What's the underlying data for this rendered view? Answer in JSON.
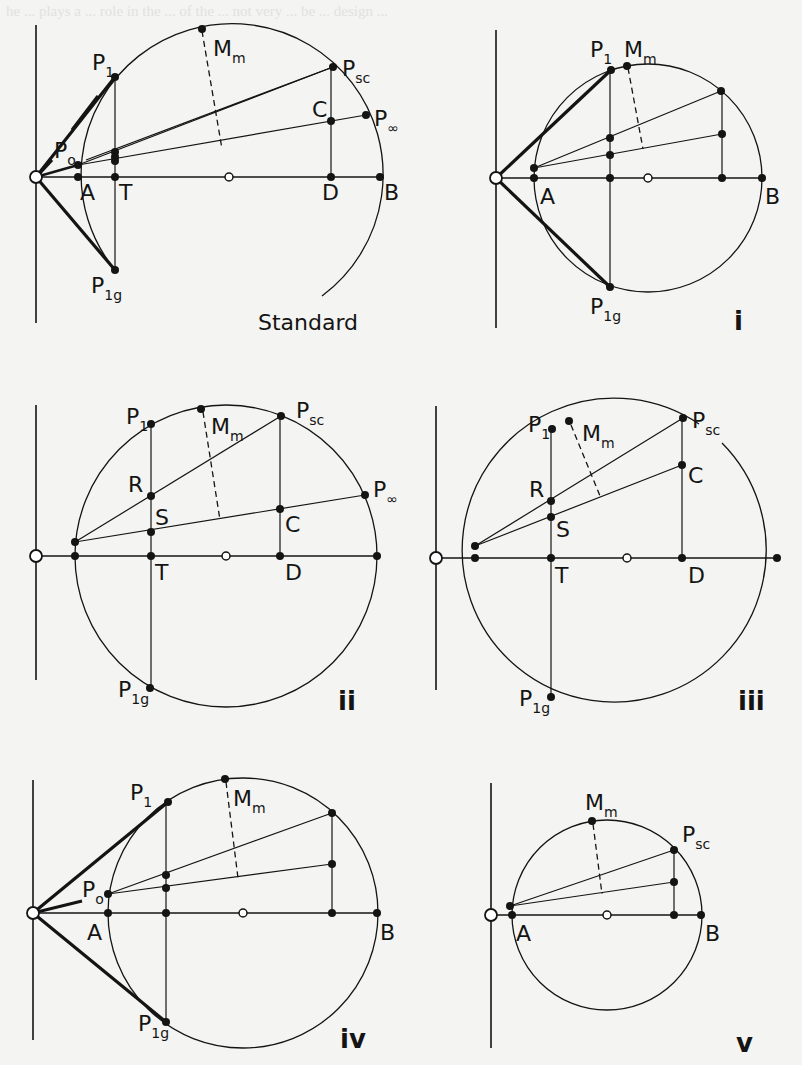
{
  "figure": {
    "background_color": "#f4f4f2",
    "ink_color": "#141414",
    "ghost_text_color": "#e2e2df",
    "background_text": "he ... plays a ... role in the ... of the ... not very ... be ... design ...",
    "diagrams": [
      {
        "id": "standard",
        "caption": "Standard",
        "caption_pos": [
          258,
          330
        ],
        "axis": {
          "vx": 36,
          "vy1": 25,
          "vy2": 323,
          "y": 177,
          "x1": 36,
          "x2": 380
        },
        "origin": [
          36,
          177
        ],
        "center": [
          229,
          177
        ],
        "radius": 151,
        "arc_partial": true,
        "arc_start": [
          115,
          270
        ],
        "arc_end": [
          322,
          296
        ],
        "points": {
          "A": [
            78,
            177
          ],
          "T": [
            115,
            177
          ],
          "D": [
            331,
            177
          ],
          "B": [
            380,
            177
          ],
          "P1": [
            115,
            77
          ],
          "P1g": [
            115,
            270
          ],
          "Mm": [
            202,
            29
          ],
          "Psc": [
            333,
            67
          ],
          "C": [
            331,
            121
          ],
          "Pinf": [
            366,
            115
          ],
          "P0": [
            78,
            165
          ]
        },
        "labels": [
          {
            "text": "P",
            "sub": "1",
            "x": 92,
            "y": 70
          },
          {
            "text": "M",
            "sub": "m",
            "x": 213,
            "y": 56
          },
          {
            "text": "P",
            "sub": "sc",
            "x": 342,
            "y": 76
          },
          {
            "text": "C",
            "sub": "",
            "x": 312,
            "y": 117
          },
          {
            "text": "P",
            "sub": "∞",
            "x": 374,
            "y": 126
          },
          {
            "text": "P",
            "sub": "o",
            "x": 54,
            "y": 158
          },
          {
            "text": "A",
            "sub": "",
            "x": 80,
            "y": 200
          },
          {
            "text": "T",
            "sub": "",
            "x": 119,
            "y": 200
          },
          {
            "text": "D",
            "sub": "",
            "x": 322,
            "y": 200
          },
          {
            "text": "B",
            "sub": "",
            "x": 384,
            "y": 200
          },
          {
            "text": "P",
            "sub": "1g",
            "x": 91,
            "y": 293
          }
        ],
        "thick_lines": [
          [
            [
              36,
              177
            ],
            [
              115,
              77
            ]
          ],
          [
            [
              36,
              177
            ],
            [
              115,
              270
            ]
          ]
        ],
        "thin_lines": [
          [
            [
              78,
              165
            ],
            [
              333,
              67
            ]
          ],
          [
            [
              86,
              160
            ],
            [
              333,
              67
            ]
          ],
          [
            [
              78,
              165
            ],
            [
              366,
              115
            ]
          ],
          [
            [
              115,
              77
            ],
            [
              115,
              270
            ]
          ],
          [
            [
              331,
              67
            ],
            [
              331,
              177
            ]
          ]
        ],
        "dashed": [
          [
            202,
            31
          ],
          [
            222,
            149
          ]
        ],
        "dots": [
          [
            115,
            152
          ],
          [
            115,
            157
          ],
          [
            115,
            161
          ]
        ]
      },
      {
        "id": "i",
        "caption": "i",
        "caption_pos": [
          734,
          330
        ],
        "axis": {
          "vx": 496,
          "vy1": 30,
          "vy2": 328,
          "y": 178,
          "x1": 496,
          "x2": 762
        },
        "origin": [
          496,
          178
        ],
        "center": [
          648,
          178
        ],
        "radius": 114,
        "arc_partial": false,
        "points": {
          "A": [
            534,
            178
          ],
          "T": [
            610,
            178
          ],
          "D": [
            722,
            178
          ],
          "B": [
            762,
            178
          ],
          "P1": [
            611,
            70
          ],
          "P1g": [
            610,
            287
          ],
          "Mm": [
            627,
            66
          ],
          "Psc": [
            721,
            91
          ],
          "C": [
            722,
            134
          ],
          "P0": [
            534,
            168
          ],
          "R": [
            610,
            138
          ],
          "S": [
            610,
            155
          ]
        },
        "labels": [
          {
            "text": "P",
            "sub": "1",
            "x": 590,
            "y": 57
          },
          {
            "text": "M",
            "sub": "m",
            "x": 624,
            "y": 57
          },
          {
            "text": "A",
            "sub": "",
            "x": 540,
            "y": 204
          },
          {
            "text": "B",
            "sub": "",
            "x": 765,
            "y": 204
          },
          {
            "text": "P",
            "sub": "1g",
            "x": 590,
            "y": 314
          }
        ],
        "thick_lines": [
          [
            [
              496,
              178
            ],
            [
              611,
              70
            ]
          ],
          [
            [
              496,
              178
            ],
            [
              610,
              287
            ]
          ]
        ],
        "thin_lines": [
          [
            [
              534,
              168
            ],
            [
              721,
              91
            ]
          ],
          [
            [
              534,
              168
            ],
            [
              722,
              134
            ]
          ],
          [
            [
              610,
              70
            ],
            [
              610,
              287
            ]
          ],
          [
            [
              722,
              91
            ],
            [
              722,
              178
            ]
          ]
        ],
        "dashed": [
          [
            628,
            68
          ],
          [
            643,
            149
          ]
        ],
        "dots": []
      },
      {
        "id": "ii",
        "caption": "ii",
        "caption_pos": [
          338,
          710
        ],
        "axis": {
          "vx": 36,
          "vy1": 405,
          "vy2": 680,
          "y": 556,
          "x1": 36,
          "x2": 377
        },
        "origin": [
          36,
          556
        ],
        "center": [
          226,
          556
        ],
        "radius": 151,
        "arc_partial": false,
        "points": {
          "A": [
            75,
            556
          ],
          "T": [
            151,
            556
          ],
          "D": [
            280,
            556
          ],
          "B": [
            377,
            556
          ],
          "P1": [
            151,
            424
          ],
          "P1g": [
            150,
            688
          ],
          "Mm": [
            201,
            409
          ],
          "Psc": [
            281,
            416
          ],
          "C": [
            280,
            509
          ],
          "Pinf": [
            365,
            495
          ],
          "P0": [
            75,
            542
          ],
          "R": [
            151,
            496
          ],
          "S": [
            151,
            532
          ]
        },
        "labels": [
          {
            "text": "P",
            "sub": "1",
            "x": 126,
            "y": 424
          },
          {
            "text": "M",
            "sub": "m",
            "x": 211,
            "y": 434
          },
          {
            "text": "P",
            "sub": "sc",
            "x": 296,
            "y": 418
          },
          {
            "text": "R",
            "sub": "",
            "x": 128,
            "y": 492
          },
          {
            "text": "S",
            "sub": "",
            "x": 155,
            "y": 525
          },
          {
            "text": "P",
            "sub": "∞",
            "x": 373,
            "y": 497
          },
          {
            "text": "C",
            "sub": "",
            "x": 285,
            "y": 532
          },
          {
            "text": "T",
            "sub": "",
            "x": 155,
            "y": 580
          },
          {
            "text": "D",
            "sub": "",
            "x": 285,
            "y": 580
          },
          {
            "text": "P",
            "sub": "1g",
            "x": 118,
            "y": 697
          }
        ],
        "thick_lines": [],
        "thin_lines": [
          [
            [
              75,
              542
            ],
            [
              281,
              416
            ]
          ],
          [
            [
              75,
              542
            ],
            [
              365,
              495
            ]
          ],
          [
            [
              151,
              424
            ],
            [
              151,
              688
            ]
          ],
          [
            [
              280,
              416
            ],
            [
              280,
              556
            ]
          ]
        ],
        "dashed": [
          [
            203,
            412
          ],
          [
            220,
            520
          ]
        ],
        "dots": []
      },
      {
        "id": "iii",
        "caption": "iii",
        "caption_pos": [
          738,
          710
        ],
        "axis": {
          "vx": 436,
          "vy1": 406,
          "vy2": 690,
          "y": 558,
          "x1": 436,
          "x2": 777
        },
        "origin": [
          436,
          558
        ],
        "center": [
          627,
          558
        ],
        "radius": 152,
        "arc_partial": true,
        "arc_start": [
          722,
          443
        ],
        "arc_end": [
          699,
          424
        ],
        "points": {
          "A": [
            475,
            558
          ],
          "T": [
            551,
            558
          ],
          "D": [
            682,
            558
          ],
          "B": [
            777,
            558
          ],
          "P1": [
            552,
            429
          ],
          "P1g": [
            551,
            697
          ],
          "Mm": [
            569,
            421
          ],
          "Psc": [
            683,
            418
          ],
          "C": [
            682,
            465
          ],
          "P0": [
            475,
            546
          ],
          "R": [
            551,
            501
          ],
          "S": [
            551,
            517
          ]
        },
        "labels": [
          {
            "text": "P",
            "sub": "1",
            "x": 528,
            "y": 432
          },
          {
            "text": "M",
            "sub": "m",
            "x": 582,
            "y": 441
          },
          {
            "text": "P",
            "sub": "sc",
            "x": 692,
            "y": 428
          },
          {
            "text": "R",
            "sub": "",
            "x": 529,
            "y": 497
          },
          {
            "text": "S",
            "sub": "",
            "x": 556,
            "y": 537
          },
          {
            "text": "C",
            "sub": "",
            "x": 688,
            "y": 483
          },
          {
            "text": "T",
            "sub": "",
            "x": 555,
            "y": 583
          },
          {
            "text": "D",
            "sub": "",
            "x": 688,
            "y": 583
          },
          {
            "text": "P",
            "sub": "1g",
            "x": 519,
            "y": 706
          }
        ],
        "thick_lines": [],
        "thin_lines": [
          [
            [
              475,
              546
            ],
            [
              683,
              418
            ]
          ],
          [
            [
              475,
              546
            ],
            [
              682,
              465
            ]
          ],
          [
            [
              551,
              429
            ],
            [
              551,
              697
            ]
          ],
          [
            [
              682,
              418
            ],
            [
              682,
              558
            ]
          ]
        ],
        "dashed": [
          [
            571,
            425
          ],
          [
            600,
            496
          ]
        ],
        "dots": []
      },
      {
        "id": "iv",
        "caption": "iv",
        "caption_pos": [
          340,
          1048
        ],
        "axis": {
          "vx": 33,
          "vy1": 780,
          "vy2": 1040,
          "y": 913,
          "x1": 33,
          "x2": 377
        },
        "origin": [
          33,
          913
        ],
        "center": [
          243,
          913
        ],
        "radius": 135,
        "arc_partial": false,
        "points": {
          "A": [
            108,
            913
          ],
          "T": [
            166,
            913
          ],
          "D": [
            332,
            913
          ],
          "B": [
            377,
            913
          ],
          "P1": [
            168,
            802
          ],
          "P1g": [
            166,
            1022
          ],
          "Mm": [
            225,
            779
          ],
          "Psc": [
            332,
            813
          ],
          "C": [
            332,
            864
          ],
          "P0": [
            108,
            894
          ],
          "R": [
            166,
            875
          ],
          "S": [
            166,
            888
          ]
        },
        "labels": [
          {
            "text": "P",
            "sub": "1",
            "x": 130,
            "y": 800
          },
          {
            "text": "M",
            "sub": "m",
            "x": 233,
            "y": 806
          },
          {
            "text": "P",
            "sub": "o",
            "x": 82,
            "y": 897
          },
          {
            "text": "A",
            "sub": "",
            "x": 87,
            "y": 940
          },
          {
            "text": "B",
            "sub": "",
            "x": 380,
            "y": 940
          },
          {
            "text": "P",
            "sub": "1g",
            "x": 138,
            "y": 1031
          }
        ],
        "thick_lines": [
          [
            [
              33,
              913
            ],
            [
              168,
              802
            ]
          ],
          [
            [
              33,
              913
            ],
            [
              166,
              1022
            ]
          ],
          [
            [
              33,
              913
            ],
            [
              82,
              901
            ]
          ]
        ],
        "thin_lines": [
          [
            [
              108,
              894
            ],
            [
              332,
              813
            ]
          ],
          [
            [
              108,
              894
            ],
            [
              332,
              864
            ]
          ],
          [
            [
              166,
              802
            ],
            [
              166,
              1022
            ]
          ],
          [
            [
              332,
              813
            ],
            [
              332,
              913
            ]
          ]
        ],
        "dashed": [
          [
            226,
            782
          ],
          [
            238,
            878
          ]
        ],
        "dots": []
      },
      {
        "id": "v",
        "caption": "v",
        "caption_pos": [
          736,
          1052
        ],
        "axis": {
          "vx": 491,
          "vy1": 783,
          "vy2": 1048,
          "y": 915,
          "x1": 491,
          "x2": 701
        },
        "origin": [
          491,
          915
        ],
        "center": [
          607,
          915
        ],
        "radius": 95,
        "arc_partial": false,
        "points": {
          "A": [
            512,
            915
          ],
          "D": [
            674,
            915
          ],
          "B": [
            701,
            915
          ],
          "Mm": [
            592,
            821
          ],
          "Psc": [
            674,
            850
          ],
          "C": [
            674,
            882
          ],
          "P0": [
            510,
            906
          ]
        },
        "labels": [
          {
            "text": "M",
            "sub": "m",
            "x": 585,
            "y": 810
          },
          {
            "text": "P",
            "sub": "sc",
            "x": 682,
            "y": 842
          },
          {
            "text": "A",
            "sub": "",
            "x": 516,
            "y": 941
          },
          {
            "text": "B",
            "sub": "",
            "x": 705,
            "y": 941
          }
        ],
        "thick_lines": [],
        "thin_lines": [
          [
            [
              510,
              906
            ],
            [
              674,
              850
            ]
          ],
          [
            [
              510,
              906
            ],
            [
              674,
              882
            ]
          ],
          [
            [
              674,
              850
            ],
            [
              674,
              915
            ]
          ]
        ],
        "dashed": [
          [
            593,
            824
          ],
          [
            602,
            894
          ]
        ],
        "dots": []
      }
    ]
  }
}
